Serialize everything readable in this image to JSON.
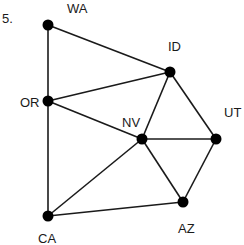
{
  "problem_number": "5.",
  "nodes": [
    {
      "id": "WA",
      "label": "WA",
      "x": 48,
      "y": 25,
      "lx": 67,
      "ly": 2
    },
    {
      "id": "OR",
      "label": "OR",
      "x": 48,
      "y": 101,
      "lx": 20,
      "ly": 96
    },
    {
      "id": "ID",
      "label": "ID",
      "x": 170,
      "y": 72,
      "lx": 168,
      "ly": 40
    },
    {
      "id": "NV",
      "label": "NV",
      "x": 142,
      "y": 139,
      "lx": 122,
      "ly": 116
    },
    {
      "id": "UT",
      "label": "UT",
      "x": 216,
      "y": 139,
      "lx": 224,
      "ly": 106
    },
    {
      "id": "AZ",
      "label": "AZ",
      "x": 183,
      "y": 202,
      "lx": 178,
      "ly": 222
    },
    {
      "id": "CA",
      "label": "CA",
      "x": 48,
      "y": 216,
      "lx": 38,
      "ly": 232
    }
  ],
  "edges": [
    [
      "WA",
      "OR"
    ],
    [
      "WA",
      "ID"
    ],
    [
      "OR",
      "ID"
    ],
    [
      "OR",
      "NV"
    ],
    [
      "OR",
      "CA"
    ],
    [
      "ID",
      "NV"
    ],
    [
      "ID",
      "UT"
    ],
    [
      "NV",
      "UT"
    ],
    [
      "NV",
      "AZ"
    ],
    [
      "NV",
      "CA"
    ],
    [
      "UT",
      "AZ"
    ],
    [
      "CA",
      "AZ"
    ]
  ],
  "colors": {
    "line": "#1a1a1a",
    "node": "#000000",
    "text": "#1a1a1a"
  }
}
